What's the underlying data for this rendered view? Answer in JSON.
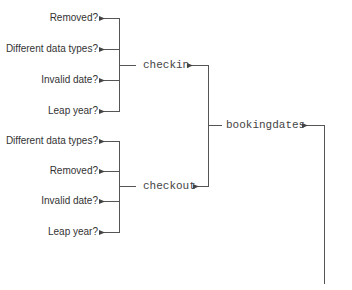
{
  "diagram": {
    "root": {
      "label": "bookingdates"
    },
    "branches": [
      {
        "label": "checkin",
        "leaves": [
          {
            "label": "Removed?"
          },
          {
            "label": "Different data types?"
          },
          {
            "label": "Invalid date?"
          },
          {
            "label": "Leap year?"
          }
        ]
      },
      {
        "label": "checkout",
        "leaves": [
          {
            "label": "Different data types?"
          },
          {
            "label": "Removed?"
          },
          {
            "label": "Invalid date?"
          },
          {
            "label": "Leap year?"
          }
        ]
      }
    ],
    "colors": {
      "line": "#555555",
      "leaf_text": "#333333",
      "node_text": "#444444",
      "background": "#ffffff"
    }
  }
}
